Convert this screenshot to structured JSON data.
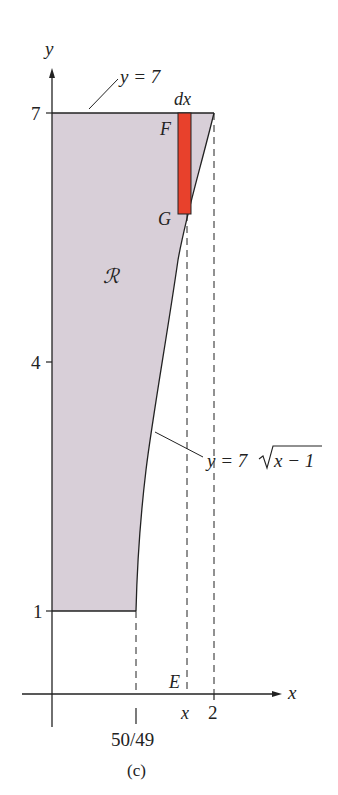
{
  "figure": {
    "caption": "(c)",
    "region_label": "ℛ",
    "axes": {
      "x_label": "x",
      "y_label": "y",
      "y_ticks": [
        "7",
        "4",
        "1"
      ],
      "x_ticks": [
        "50/49",
        "x",
        "2"
      ]
    },
    "curves": {
      "top_line_label": "y = 7",
      "curve_label_prefix": "y = 7",
      "curve_label_radicand": "x − 1"
    },
    "strip": {
      "width_label": "dx",
      "top_point": "F",
      "bottom_point": "G",
      "axis_point": "E",
      "color": "#e8412c"
    },
    "colors": {
      "region_fill": "#d8cfd8",
      "line": "#222222"
    }
  }
}
